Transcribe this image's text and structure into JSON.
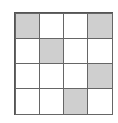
{
  "grid": {
    "rows": 4,
    "cols": 4,
    "shaded_color": "#cfcfcf",
    "cells": [
      [
        1,
        0,
        0,
        1
      ],
      [
        0,
        1,
        0,
        0
      ],
      [
        0,
        0,
        0,
        1
      ],
      [
        0,
        0,
        1,
        0
      ]
    ]
  }
}
